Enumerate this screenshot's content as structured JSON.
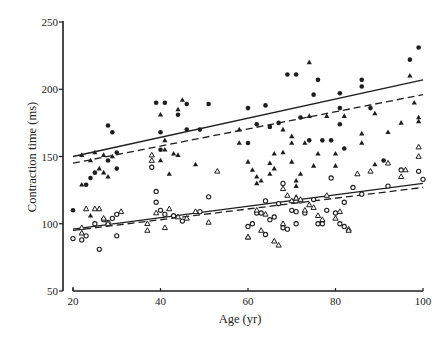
{
  "chart_data": {
    "type": "scatter",
    "title": "",
    "xlabel": "Age (yr)",
    "ylabel": "Contraction time (ms)",
    "xlim": [
      20,
      100
    ],
    "ylim": [
      50,
      250
    ],
    "xticks": [
      20,
      40,
      60,
      80,
      100
    ],
    "yticks": [
      50,
      100,
      150,
      200,
      250
    ],
    "grid": false,
    "legend": "none",
    "series": [
      {
        "name": "filled-circles",
        "marker": "filled-circle",
        "points": [
          [
            20,
            110
          ],
          [
            23,
            129
          ],
          [
            24,
            134
          ],
          [
            25,
            138
          ],
          [
            28,
            147
          ],
          [
            29,
            168
          ],
          [
            28,
            173
          ],
          [
            30,
            153
          ],
          [
            30,
            141
          ],
          [
            39,
            190
          ],
          [
            41,
            190
          ],
          [
            40,
            155
          ],
          [
            40,
            168
          ],
          [
            44,
            181
          ],
          [
            46,
            189
          ],
          [
            49,
            170
          ],
          [
            46,
            170
          ],
          [
            51,
            189
          ],
          [
            60,
            186
          ],
          [
            62,
            174
          ],
          [
            64,
            188
          ],
          [
            65,
            172
          ],
          [
            69,
            211
          ],
          [
            71,
            211
          ],
          [
            72,
            179
          ],
          [
            74,
            162
          ],
          [
            76,
            207
          ],
          [
            75,
            196
          ],
          [
            77,
            162
          ],
          [
            79,
            162
          ],
          [
            81,
            197
          ],
          [
            81,
            186
          ],
          [
            81,
            174
          ],
          [
            82,
            156
          ],
          [
            86,
            207
          ],
          [
            86,
            202
          ],
          [
            91,
            147
          ],
          [
            97,
            222
          ],
          [
            99,
            231
          ],
          [
            60,
            160
          ],
          [
            67,
            175
          ],
          [
            88,
            186
          ]
        ]
      },
      {
        "name": "filled-triangles",
        "marker": "filled-triangle",
        "points": [
          [
            22,
            151
          ],
          [
            22,
            129
          ],
          [
            24,
            106
          ],
          [
            24,
            147
          ],
          [
            25,
            153
          ],
          [
            26,
            141
          ],
          [
            27,
            151
          ],
          [
            27,
            138
          ],
          [
            28,
            135
          ],
          [
            29,
            150
          ],
          [
            40,
            147
          ],
          [
            40,
            181
          ],
          [
            41,
            162
          ],
          [
            41,
            155
          ],
          [
            42,
            137
          ],
          [
            43,
            152
          ],
          [
            44,
            185
          ],
          [
            45,
            192
          ],
          [
            48,
            144
          ],
          [
            44,
            151
          ],
          [
            58,
            160
          ],
          [
            58,
            170
          ],
          [
            60,
            146
          ],
          [
            61,
            140
          ],
          [
            62,
            135
          ],
          [
            63,
            132
          ],
          [
            62,
            130
          ],
          [
            65,
            145
          ],
          [
            65,
            137
          ],
          [
            66,
            141
          ],
          [
            66,
            152
          ],
          [
            68,
            170
          ],
          [
            68,
            153
          ],
          [
            70,
            160
          ],
          [
            70,
            165
          ],
          [
            70,
            146
          ],
          [
            71,
            132
          ],
          [
            71,
            128
          ],
          [
            71,
            120
          ],
          [
            72,
            137
          ],
          [
            73,
            160
          ],
          [
            74,
            180
          ],
          [
            74,
            220
          ],
          [
            75,
            143
          ],
          [
            76,
            152
          ],
          [
            78,
            180
          ],
          [
            80,
            152
          ],
          [
            80,
            143
          ],
          [
            82,
            180
          ],
          [
            86,
            167
          ],
          [
            86,
            160
          ],
          [
            89,
            182
          ],
          [
            89,
            144
          ],
          [
            92,
            168
          ],
          [
            95,
            175
          ],
          [
            97,
            210
          ],
          [
            98,
            190
          ],
          [
            99,
            179
          ],
          [
            99,
            176
          ]
        ]
      },
      {
        "name": "open-circles",
        "marker": "open-circle",
        "points": [
          [
            20,
            89
          ],
          [
            22,
            88
          ],
          [
            23,
            91
          ],
          [
            25,
            100
          ],
          [
            26,
            81
          ],
          [
            27,
            103
          ],
          [
            28,
            101
          ],
          [
            29,
            104
          ],
          [
            30,
            107
          ],
          [
            30,
            91
          ],
          [
            38,
            142
          ],
          [
            39,
            124
          ],
          [
            39,
            116
          ],
          [
            40,
            110
          ],
          [
            41,
            107
          ],
          [
            43,
            106
          ],
          [
            45,
            102
          ],
          [
            49,
            109
          ],
          [
            51,
            120
          ],
          [
            60,
            98
          ],
          [
            61,
            100
          ],
          [
            62,
            108
          ],
          [
            63,
            108
          ],
          [
            64,
            117
          ],
          [
            64,
            92
          ],
          [
            65,
            103
          ],
          [
            66,
            105
          ],
          [
            67,
            115
          ],
          [
            68,
            130
          ],
          [
            68,
            97
          ],
          [
            69,
            96
          ],
          [
            70,
            110
          ],
          [
            71,
            109
          ],
          [
            71,
            100
          ],
          [
            72,
            117
          ],
          [
            73,
            108
          ],
          [
            75,
            118
          ],
          [
            76,
            100
          ],
          [
            77,
            100
          ],
          [
            78,
            110
          ],
          [
            79,
            134
          ],
          [
            80,
            108
          ],
          [
            81,
            100
          ],
          [
            82,
            98
          ],
          [
            82,
            116
          ],
          [
            84,
            127
          ],
          [
            86,
            122
          ],
          [
            92,
            128
          ],
          [
            95,
            140
          ],
          [
            99,
            139
          ],
          [
            100,
            133
          ]
        ]
      },
      {
        "name": "open-triangles",
        "marker": "open-triangle",
        "points": [
          [
            22,
            93
          ],
          [
            22,
            97
          ],
          [
            23,
            111
          ],
          [
            25,
            111
          ],
          [
            26,
            111
          ],
          [
            27,
            104
          ],
          [
            28,
            100
          ],
          [
            31,
            109
          ],
          [
            37,
            100
          ],
          [
            37,
            95
          ],
          [
            38,
            151
          ],
          [
            38,
            147
          ],
          [
            39,
            108
          ],
          [
            41,
            97
          ],
          [
            42,
            111
          ],
          [
            44,
            105
          ],
          [
            46,
            104
          ],
          [
            48,
            109
          ],
          [
            51,
            101
          ],
          [
            53,
            139
          ],
          [
            60,
            90
          ],
          [
            60,
            90
          ],
          [
            63,
            95
          ],
          [
            62,
            110
          ],
          [
            64,
            107
          ],
          [
            66,
            87
          ],
          [
            67,
            84
          ],
          [
            68,
            100
          ],
          [
            68,
            126
          ],
          [
            69,
            121
          ],
          [
            70,
            117
          ],
          [
            71,
            119
          ],
          [
            72,
            118
          ],
          [
            73,
            110
          ],
          [
            74,
            114
          ],
          [
            75,
            112
          ],
          [
            76,
            106
          ],
          [
            77,
            103
          ],
          [
            78,
            121
          ],
          [
            80,
            104
          ],
          [
            81,
            109
          ],
          [
            83,
            96
          ],
          [
            83,
            95
          ],
          [
            85,
            137
          ],
          [
            88,
            139
          ],
          [
            92,
            145
          ],
          [
            95,
            135
          ],
          [
            96,
            140
          ],
          [
            99,
            157
          ],
          [
            99,
            150
          ]
        ]
      }
    ],
    "regression_lines": [
      {
        "name": "upper-solid",
        "style": "solid",
        "x": [
          20,
          100
        ],
        "y": [
          150,
          207
        ]
      },
      {
        "name": "upper-dashed",
        "style": "dashed",
        "x": [
          20,
          100
        ],
        "y": [
          145,
          196
        ]
      },
      {
        "name": "lower-solid",
        "style": "solid",
        "x": [
          20,
          100
        ],
        "y": [
          96,
          130
        ]
      },
      {
        "name": "lower-dashed",
        "style": "dashed",
        "x": [
          20,
          100
        ],
        "y": [
          95,
          127
        ]
      }
    ]
  }
}
